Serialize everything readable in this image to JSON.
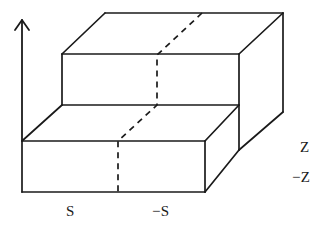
{
  "figure": {
    "kind": "line-drawing",
    "background_color": "#ffffff",
    "stroke_color": "#1a1a1a",
    "labels": {
      "s": "S",
      "neg_s": "−S",
      "z": "Z",
      "neg_z": "−Z"
    },
    "axis": {
      "vertical_arrow": {
        "name": "vertical-axis-arrow",
        "from_x": 22,
        "from_y": 141,
        "to_x": 22,
        "to_y": 20,
        "head_left_x": 16,
        "head_left_y": 29,
        "head_right_x": 28,
        "head_right_y": 29
      }
    },
    "geometry": {
      "front_lower_face": "M 22 141 L 205 141 L 205 192 L 22 192 Z",
      "upper_front_face": "M 62 54 L 239 54 L 239 105 L 62 105 Z",
      "upper_top_face": "M 105 13 L 283 13 L 239 54 L 62 54 Z",
      "lower_top_face": "M 62 105 L 239 105 L 205 141 L 22 141 Z",
      "right_side_face": "M 239 54 L 283 13 L 283 112 L 239 150 Z",
      "lower_right_face": "M 205 141 L 239 105 L 239 150 L 205 192 Z",
      "hidden_path": "M 202 13 L 157 55 L 157 105 L 118 141 L 118 192"
    }
  }
}
